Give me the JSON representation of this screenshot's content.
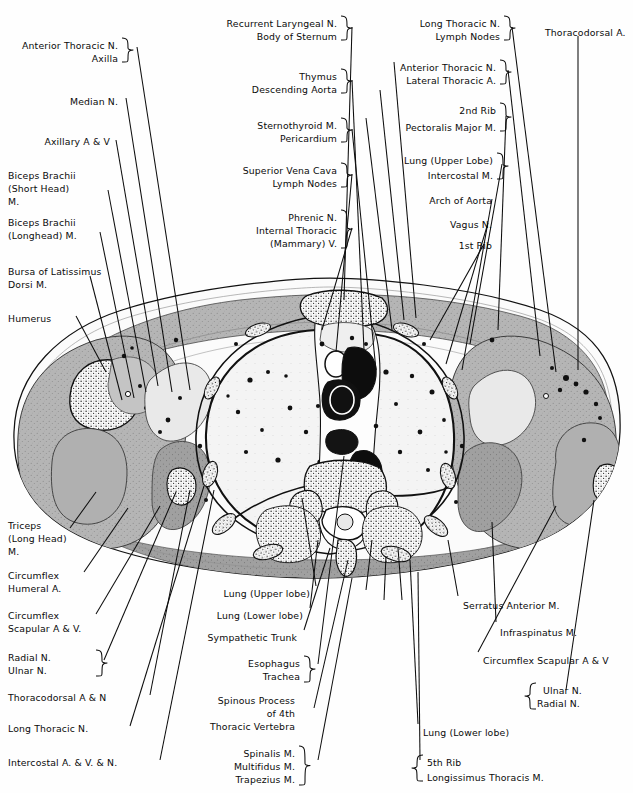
{
  "figure": {
    "type": "anatomical-cross-section",
    "region": "Transverse section of thorax at level of 4th thoracic vertebra",
    "background_color": "#fefefe",
    "ink_color": "#0a0a0a",
    "fill_light": "#f2f2f2",
    "fill_mid": "#b9b9b9",
    "fill_dark": "#8e8e8e"
  },
  "labels_top_left": [
    {
      "id": "anterior-thoracic-n",
      "lines": [
        "Anterior Thoracic N."
      ],
      "x": 118,
      "y": 40,
      "align": "right",
      "brace": true
    },
    {
      "id": "axilla",
      "lines": [
        "Axilla"
      ],
      "x": 118,
      "y": 53,
      "align": "right",
      "brace": true
    },
    {
      "id": "median-n",
      "lines": [
        "Median N."
      ],
      "x": 118,
      "y": 96,
      "align": "right",
      "brace": false
    },
    {
      "id": "axillary-a-v",
      "lines": [
        "Axillary A & V"
      ],
      "x": 110,
      "y": 136,
      "align": "right",
      "brace": false
    },
    {
      "id": "biceps-brachii-short-head",
      "lines": [
        "Biceps Brachii",
        "(Short Head)",
        "M."
      ],
      "x": 8,
      "y": 170,
      "align": "left",
      "brace": false
    },
    {
      "id": "biceps-brachii-longhead",
      "lines": [
        "Biceps Brachii",
        "(Longhead) M."
      ],
      "x": 8,
      "y": 217,
      "align": "left",
      "brace": false
    },
    {
      "id": "bursa-of-latissimus-dorsi",
      "lines": [
        "Bursa of Latissimus",
        "Dorsi M."
      ],
      "x": 8,
      "y": 266,
      "align": "left",
      "brace": false
    },
    {
      "id": "humerus",
      "lines": [
        "Humerus"
      ],
      "x": 8,
      "y": 313,
      "align": "left",
      "brace": false
    }
  ],
  "labels_top_center": [
    {
      "id": "recurrent-laryngeal-n",
      "lines": [
        "Recurrent Laryngeal N."
      ],
      "x": 337,
      "y": 18,
      "align": "right",
      "brace": true
    },
    {
      "id": "body-of-sternum",
      "lines": [
        "Body of Sternum"
      ],
      "x": 337,
      "y": 31,
      "align": "right",
      "brace": true
    },
    {
      "id": "thymus",
      "lines": [
        "Thymus"
      ],
      "x": 337,
      "y": 71,
      "align": "right",
      "brace": true
    },
    {
      "id": "descending-aorta",
      "lines": [
        "Descending Aorta"
      ],
      "x": 337,
      "y": 84,
      "align": "right",
      "brace": true
    },
    {
      "id": "sternothyroid-m",
      "lines": [
        "Sternothyroid M."
      ],
      "x": 337,
      "y": 120,
      "align": "right",
      "brace": true
    },
    {
      "id": "pericardium",
      "lines": [
        "Pericardium"
      ],
      "x": 337,
      "y": 133,
      "align": "right",
      "brace": true
    },
    {
      "id": "superior-vena-cava",
      "lines": [
        "Superior Vena Cava"
      ],
      "x": 337,
      "y": 165,
      "align": "right",
      "brace": true
    },
    {
      "id": "lymph-nodes-center",
      "lines": [
        "Lymph Nodes"
      ],
      "x": 337,
      "y": 178,
      "align": "right",
      "brace": true
    },
    {
      "id": "phrenic-n",
      "lines": [
        "Phrenic N."
      ],
      "x": 337,
      "y": 212,
      "align": "right",
      "brace": true
    },
    {
      "id": "internal-thoracic",
      "lines": [
        "Internal Thoracic"
      ],
      "x": 337,
      "y": 225,
      "align": "right",
      "brace": true
    },
    {
      "id": "mammary-v",
      "lines": [
        "(Mammary) V."
      ],
      "x": 337,
      "y": 238,
      "align": "right",
      "brace": true
    }
  ],
  "labels_top_right": [
    {
      "id": "long-thoracic-n-top",
      "lines": [
        "Long Thoracic N."
      ],
      "x": 500,
      "y": 18,
      "align": "right",
      "brace": true
    },
    {
      "id": "lymph-nodes-right",
      "lines": [
        "Lymph Nodes"
      ],
      "x": 500,
      "y": 31,
      "align": "right",
      "brace": true
    },
    {
      "id": "thoracodorsal-a",
      "lines": [
        "Thoracodorsal A."
      ],
      "x": 545,
      "y": 27,
      "align": "left",
      "brace": false
    },
    {
      "id": "anterior-thoracic-n-right",
      "lines": [
        "Anterior Thoracic N."
      ],
      "x": 496,
      "y": 62,
      "align": "right",
      "brace": true
    },
    {
      "id": "lateral-thoracic-a",
      "lines": [
        "Lateral Thoracic A."
      ],
      "x": 496,
      "y": 75,
      "align": "right",
      "brace": true
    },
    {
      "id": "2nd-rib",
      "lines": [
        "2nd Rib"
      ],
      "x": 496,
      "y": 105,
      "align": "right",
      "brace": true
    },
    {
      "id": "pectoralis-major-m",
      "lines": [
        "Pectoralis Major M."
      ],
      "x": 496,
      "y": 122,
      "align": "right",
      "brace": true
    },
    {
      "id": "lung-upper-lobe-right",
      "lines": [
        "Lung (Upper Lobe)"
      ],
      "x": 493,
      "y": 155,
      "align": "right",
      "brace": true
    },
    {
      "id": "intercostal-m",
      "lines": [
        "Intercostal M."
      ],
      "x": 493,
      "y": 170,
      "align": "right",
      "brace": true
    },
    {
      "id": "arch-of-aorta",
      "lines": [
        "Arch of Aorta"
      ],
      "x": 492,
      "y": 195,
      "align": "right",
      "brace": false
    },
    {
      "id": "vagus-n",
      "lines": [
        "Vagus N."
      ],
      "x": 492,
      "y": 219,
      "align": "right",
      "brace": false
    },
    {
      "id": "1st-rib",
      "lines": [
        "1st Rib"
      ],
      "x": 492,
      "y": 240,
      "align": "right",
      "brace": false
    }
  ],
  "labels_bottom_left": [
    {
      "id": "triceps-long-head",
      "lines": [
        "Triceps",
        "(Long Head)",
        "M."
      ],
      "x": 8,
      "y": 520,
      "align": "left",
      "brace": false
    },
    {
      "id": "circumflex-humeral-a",
      "lines": [
        "Circumflex",
        "Humeral A."
      ],
      "x": 8,
      "y": 570,
      "align": "left",
      "brace": false
    },
    {
      "id": "circumflex-scapular-a-v-left",
      "lines": [
        "Circumflex",
        "Scapular A & V."
      ],
      "x": 8,
      "y": 610,
      "align": "left",
      "brace": false
    },
    {
      "id": "radial-n-left",
      "lines": [
        "Radial N."
      ],
      "x": 8,
      "y": 652,
      "align": "left",
      "brace": true
    },
    {
      "id": "ulnar-n-left",
      "lines": [
        "Ulnar N."
      ],
      "x": 8,
      "y": 665,
      "align": "left",
      "brace": true
    },
    {
      "id": "thoracodorsal-a-n",
      "lines": [
        "Thoracodorsal A & N"
      ],
      "x": 8,
      "y": 692,
      "align": "left",
      "brace": false
    },
    {
      "id": "long-thoracic-n-bottom",
      "lines": [
        "Long Thoracic N."
      ],
      "x": 8,
      "y": 723,
      "align": "left",
      "brace": false
    },
    {
      "id": "intercostal-a-v-n",
      "lines": [
        "Intercostal A. & V. & N."
      ],
      "x": 8,
      "y": 757,
      "align": "left",
      "brace": false
    }
  ],
  "labels_bottom_center": [
    {
      "id": "lung-upper-lobe-bottom",
      "lines": [
        "Lung (Upper lobe)"
      ],
      "x": 310,
      "y": 588,
      "align": "right",
      "brace": false
    },
    {
      "id": "lung-lower-lobe-center",
      "lines": [
        "Lung (Lower lobe)"
      ],
      "x": 303,
      "y": 610,
      "align": "right",
      "brace": false
    },
    {
      "id": "sympathetic-trunk",
      "lines": [
        "Sympathetic Trunk"
      ],
      "x": 297,
      "y": 632,
      "align": "right",
      "brace": false
    },
    {
      "id": "esophagus",
      "lines": [
        "Esophagus"
      ],
      "x": 300,
      "y": 658,
      "align": "right",
      "brace": true
    },
    {
      "id": "trachea",
      "lines": [
        "Trachea"
      ],
      "x": 300,
      "y": 671,
      "align": "right",
      "brace": true
    },
    {
      "id": "spinous-process",
      "lines": [
        "Spinous Process"
      ],
      "x": 295,
      "y": 695,
      "align": "right",
      "brace": false
    },
    {
      "id": "of-4th",
      "lines": [
        "of 4th"
      ],
      "x": 295,
      "y": 708,
      "align": "right",
      "brace": false
    },
    {
      "id": "thoracic-vertebra",
      "lines": [
        "Thoracic Vertebra"
      ],
      "x": 295,
      "y": 721,
      "align": "right",
      "brace": false
    },
    {
      "id": "spinalis-m",
      "lines": [
        "Spinalis M."
      ],
      "x": 295,
      "y": 748,
      "align": "right",
      "brace": true
    },
    {
      "id": "multifidus-m",
      "lines": [
        "Multifidus M."
      ],
      "x": 295,
      "y": 761,
      "align": "right",
      "brace": true
    },
    {
      "id": "trapezius-m",
      "lines": [
        "Trapezius M."
      ],
      "x": 295,
      "y": 774,
      "align": "right",
      "brace": true
    }
  ],
  "labels_bottom_right": [
    {
      "id": "serratus-anterior-m",
      "lines": [
        "Serratus Anterior M."
      ],
      "x": 463,
      "y": 600,
      "align": "left",
      "brace": false
    },
    {
      "id": "infraspinatus-m",
      "lines": [
        "Infraspinatus M."
      ],
      "x": 500,
      "y": 627,
      "align": "left",
      "brace": false
    },
    {
      "id": "circumflex-scapular-a-v-right",
      "lines": [
        "Circumflex Scapular A & V"
      ],
      "x": 483,
      "y": 655,
      "align": "left",
      "brace": false
    },
    {
      "id": "ulnar-n-right",
      "lines": [
        "Ulnar N."
      ],
      "x": 543,
      "y": 685,
      "align": "left",
      "brace": true
    },
    {
      "id": "radial-n-right",
      "lines": [
        "Radial N."
      ],
      "x": 537,
      "y": 698,
      "align": "left",
      "brace": true
    },
    {
      "id": "lung-lower-lobe-right",
      "lines": [
        "Lung (Lower lobe)"
      ],
      "x": 423,
      "y": 727,
      "align": "left",
      "brace": false
    },
    {
      "id": "5th-rib",
      "lines": [
        "5th Rib"
      ],
      "x": 427,
      "y": 757,
      "align": "left",
      "brace": true
    },
    {
      "id": "longissimus-thoracis-m",
      "lines": [
        "Longissimus Thoracis M."
      ],
      "x": 427,
      "y": 772,
      "align": "left",
      "brace": true
    }
  ]
}
